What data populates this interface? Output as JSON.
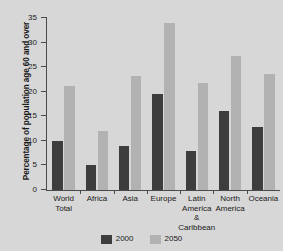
{
  "chart_data": {
    "type": "bar",
    "title": "",
    "xlabel": "",
    "ylabel": "Percentage of population age 60 and over",
    "ylim": [
      0,
      35
    ],
    "yticks": [
      "0",
      "5",
      "10",
      "15",
      "20",
      "25",
      "30",
      "35"
    ],
    "grid": false,
    "legend_position": "bottom-center",
    "categories": [
      "World Total",
      "Africa",
      "Asia",
      "Europe",
      "Latin America & Caribbean",
      "North America",
      "Oceania"
    ],
    "category_lines": [
      [
        "World",
        "Total"
      ],
      [
        "Africa"
      ],
      [
        "Asia"
      ],
      [
        "Europe"
      ],
      [
        "Latin",
        "America",
        "&",
        "Caribbean"
      ],
      [
        "North",
        "America"
      ],
      [
        "Oceania"
      ]
    ],
    "series": [
      {
        "name": "2000",
        "color": "#3d3d3d",
        "values": [
          10.0,
          5.0,
          8.9,
          19.6,
          8.0,
          16.1,
          12.9
        ]
      },
      {
        "name": "2050",
        "color": "#b2b2b2",
        "values": [
          21.2,
          12.0,
          23.3,
          33.9,
          21.7,
          27.3,
          23.6
        ]
      }
    ]
  },
  "legend": {
    "items": [
      {
        "label": "2000",
        "color": "#3d3d3d"
      },
      {
        "label": "2050",
        "color": "#b2b2b2"
      }
    ]
  },
  "colors": {
    "background": "#d7d7d7",
    "plot_background": "#d7d7d7",
    "axis": "#4a4a4a",
    "text": "#1a1a1a",
    "series_2000": "#3d3d3d",
    "series_2050": "#b2b2b2"
  }
}
